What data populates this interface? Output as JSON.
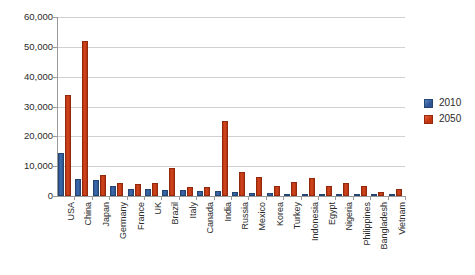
{
  "chart_data": {
    "type": "bar",
    "title": "",
    "subtitle": "",
    "xlabel": "",
    "ylabel": "",
    "grid": true,
    "legend_position": "right",
    "ylim": [
      0,
      60000
    ],
    "ytick_labels": [
      "60,000",
      "50,000",
      "40,000",
      "30,000",
      "20,000",
      "10,000",
      "0"
    ],
    "ytick_values": [
      60000,
      50000,
      40000,
      30000,
      20000,
      10000,
      0
    ],
    "categories": [
      "USA",
      "China",
      "Japan",
      "Germany",
      "France",
      "UK",
      "Brazil",
      "Italy",
      "Canada",
      "India",
      "Russia",
      "Mexico",
      "Korea",
      "Turkey",
      "Indonesia",
      "Egypt",
      "Nigeria",
      "Philippines",
      "Bangladesh",
      "Vietnam"
    ],
    "series": [
      {
        "name": "2010",
        "color": "#2f5596",
        "values": [
          14500,
          5800,
          5400,
          3200,
          2500,
          2200,
          2100,
          2000,
          1600,
          1600,
          1500,
          1000,
          1000,
          700,
          700,
          200,
          200,
          200,
          100,
          100
        ]
      },
      {
        "name": "2050",
        "color": "#c23310",
        "values": [
          34000,
          52000,
          7000,
          4500,
          4000,
          4200,
          9300,
          3000,
          3100,
          25000,
          8000,
          6500,
          3500,
          4800,
          6000,
          3500,
          4500,
          3200,
          1400,
          2300
        ]
      }
    ]
  },
  "legend": {
    "entries": [
      {
        "label": "2010",
        "color": "#2f5596"
      },
      {
        "label": "2050",
        "color": "#c23310"
      }
    ]
  }
}
